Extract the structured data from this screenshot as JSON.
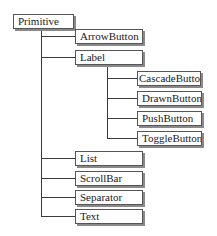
{
  "diagram": {
    "type": "class-hierarchy-tree",
    "root": {
      "label": "Primitive",
      "children": [
        {
          "label": "ArrowButton"
        },
        {
          "label": "Label",
          "children": [
            {
              "label": "CascadeButton"
            },
            {
              "label": "DrawnButton"
            },
            {
              "label": "PushButton"
            },
            {
              "label": "ToggleButton"
            }
          ]
        },
        {
          "label": "List"
        },
        {
          "label": "ScrollBar"
        },
        {
          "label": "Separator"
        },
        {
          "label": "Text"
        }
      ]
    },
    "nodes": {
      "primitive": "Primitive",
      "arrowbutton": "ArrowButton",
      "label": "Label",
      "cascadebutton": "CascadeButton",
      "drawnbutton": "DrawnButton",
      "pushbutton": "PushButton",
      "togglebutton": "ToggleButton",
      "list": "List",
      "scrollbar": "ScrollBar",
      "separator": "Separator",
      "text": "Text"
    }
  }
}
